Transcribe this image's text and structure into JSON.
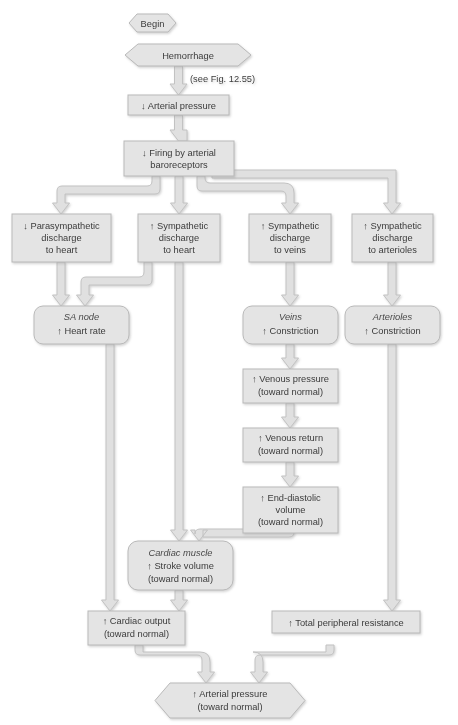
{
  "figure": {
    "kind": "physiology-flowchart",
    "note": "(see Fig. 12.55)",
    "colors": {
      "box_fill": "#e4e4e4",
      "box_stroke": "#b9b9b9",
      "hex_fill": "#e4e4e4",
      "connector_fill": "#e0e0e0",
      "connector_stroke": "#c2c2c2",
      "text": "#3b3b3b",
      "page_bg": "#ffffff"
    }
  },
  "nodes": {
    "begin": {
      "shape": "hexagon",
      "lines": [
        "Begin"
      ]
    },
    "hemorrhage": {
      "shape": "hexagon",
      "lines": [
        "Hemorrhage"
      ]
    },
    "arterial_down": {
      "shape": "rect",
      "lines": [
        "↓ Arterial pressure"
      ]
    },
    "baroreceptors": {
      "shape": "rect",
      "lines": [
        "↓ Firing by arterial",
        "baroreceptors"
      ]
    },
    "parasym_heart": {
      "shape": "rect",
      "lines": [
        "↓ Parasympathetic",
        "discharge",
        "to heart"
      ]
    },
    "sym_heart": {
      "shape": "rect",
      "lines": [
        "↑ Sympathetic",
        "discharge",
        "to heart"
      ]
    },
    "sym_veins": {
      "shape": "rect",
      "lines": [
        "↑ Sympathetic",
        "discharge",
        "to veins"
      ]
    },
    "sym_arterioles": {
      "shape": "rect",
      "lines": [
        "↑ Sympathetic",
        "discharge",
        "to arterioles"
      ]
    },
    "sa_node": {
      "shape": "round",
      "lines": [
        "SA node",
        "↑ Heart rate"
      ],
      "italic_lines": [
        0
      ]
    },
    "veins": {
      "shape": "round",
      "lines": [
        "Veins",
        "↑ Constriction"
      ],
      "italic_lines": [
        0
      ]
    },
    "arterioles": {
      "shape": "round",
      "lines": [
        "Arterioles",
        "↑ Constriction"
      ],
      "italic_lines": [
        0
      ]
    },
    "venous_press": {
      "shape": "rect",
      "lines": [
        "↑ Venous pressure",
        "(toward normal)"
      ]
    },
    "venous_return": {
      "shape": "rect",
      "lines": [
        "↑ Venous return",
        "(toward normal)"
      ]
    },
    "edv": {
      "shape": "rect",
      "lines": [
        "↑ End-diastolic",
        "volume",
        "(toward normal)"
      ]
    },
    "cardiac_muscle": {
      "shape": "round",
      "lines": [
        "Cardiac muscle",
        "↑ Stroke volume",
        "(toward normal)"
      ],
      "italic_lines": [
        0
      ]
    },
    "cardiac_output": {
      "shape": "rect",
      "lines": [
        "↑ Cardiac output",
        "(toward normal)"
      ]
    },
    "tpr": {
      "shape": "rect",
      "lines": [
        "↑ Total peripheral resistance"
      ]
    },
    "arterial_up": {
      "shape": "hexagon",
      "lines": [
        "↑ Arterial pressure",
        "(toward normal)"
      ]
    }
  },
  "edges": [
    {
      "from": "hemorrhage",
      "to": "arterial_down",
      "label": "(see Fig. 12.55)"
    },
    {
      "from": "arterial_down",
      "to": "baroreceptors",
      "label": ""
    },
    {
      "from": "baroreceptors",
      "to": "parasym_heart",
      "label": ""
    },
    {
      "from": "baroreceptors",
      "to": "sym_heart",
      "label": ""
    },
    {
      "from": "baroreceptors",
      "to": "sym_veins",
      "label": ""
    },
    {
      "from": "baroreceptors",
      "to": "sym_arterioles",
      "label": ""
    },
    {
      "from": "parasym_heart",
      "to": "sa_node",
      "label": ""
    },
    {
      "from": "sym_heart",
      "to": "sa_node",
      "label": ""
    },
    {
      "from": "sym_heart",
      "to": "cardiac_muscle",
      "label": ""
    },
    {
      "from": "sym_veins",
      "to": "veins",
      "label": ""
    },
    {
      "from": "sym_arterioles",
      "to": "arterioles",
      "label": ""
    },
    {
      "from": "veins",
      "to": "venous_press",
      "label": ""
    },
    {
      "from": "venous_press",
      "to": "venous_return",
      "label": ""
    },
    {
      "from": "venous_return",
      "to": "edv",
      "label": ""
    },
    {
      "from": "edv",
      "to": "cardiac_muscle",
      "label": ""
    },
    {
      "from": "sa_node",
      "to": "cardiac_output",
      "label": ""
    },
    {
      "from": "cardiac_muscle",
      "to": "cardiac_output",
      "label": ""
    },
    {
      "from": "arterioles",
      "to": "tpr",
      "label": ""
    },
    {
      "from": "cardiac_output",
      "to": "arterial_up",
      "label": ""
    },
    {
      "from": "tpr",
      "to": "arterial_up",
      "label": ""
    }
  ]
}
